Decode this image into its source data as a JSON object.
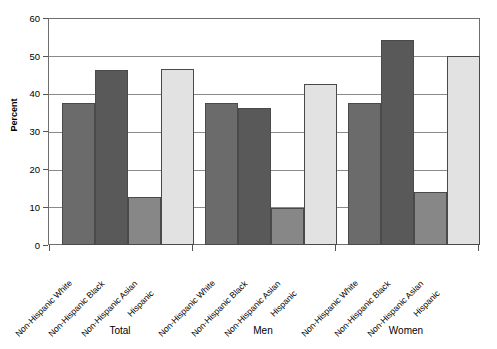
{
  "chart_data": {
    "type": "bar",
    "title": "",
    "xlabel": "",
    "ylabel": "Percent",
    "ylim": [
      0,
      60
    ],
    "yticks": [
      0,
      10,
      20,
      30,
      40,
      50,
      60
    ],
    "grid": true,
    "legend": "none",
    "groups": [
      "Total",
      "Men",
      "Women"
    ],
    "categories": [
      "Non-Hispanic White",
      "Non-Hispanic Black",
      "Non-Hispanic Asian",
      "Hispanic"
    ],
    "series": [
      {
        "name": "Total",
        "values": [
          37.8,
          46.5,
          12.7,
          46.8
        ]
      },
      {
        "name": "Men",
        "values": [
          37.6,
          36.5,
          9.8,
          42.8
        ]
      },
      {
        "name": "Women",
        "values": [
          37.6,
          54.5,
          14.2,
          50.1
        ]
      }
    ],
    "colors": {
      "Non-Hispanic White": "#6b6b6b",
      "Non-Hispanic Black": "#595959",
      "Non-Hispanic Asian": "#878787",
      "Hispanic": "#e2e2e2",
      "axis": "#6e6e6e",
      "gridline": "#8a8a8a",
      "background": "#ffffff"
    }
  },
  "axis": {
    "y_title": "Percent",
    "ytick_labels": [
      "60",
      "50",
      "40",
      "30",
      "20",
      "10",
      "0"
    ]
  },
  "group_labels": [
    "Total",
    "Men",
    "Women"
  ],
  "category_labels": {
    "total": [
      "Non-Hispanic White",
      "Non-Hispanic Black",
      "Non-Hispanic Asian",
      "Hispanic"
    ],
    "men": [
      "Non-Hispanic White",
      "Non-Hispanic Black",
      "Non-Hispanic Asian",
      "Hispanic"
    ],
    "women": [
      "Non-Hispanic White",
      "Non-Hispanic Black",
      "Non-Hispanic Asian",
      "Hispanic"
    ]
  }
}
